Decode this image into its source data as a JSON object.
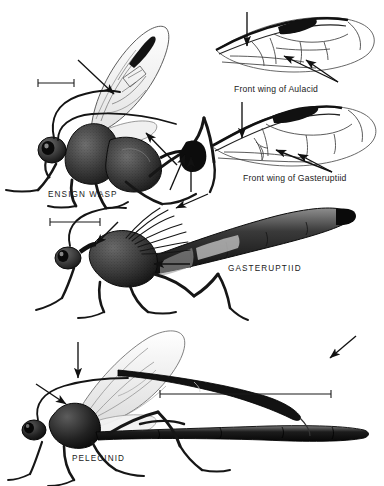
{
  "plate": {
    "title_text_present": false,
    "background_color": "#ffffff",
    "ink_color": "#1a1a1a",
    "medium": "stippled pen-and-ink scientific illustration"
  },
  "figures": [
    {
      "id": "ensign-wasp",
      "label": "ENSIGN WASP",
      "label_pos": {
        "x": 48,
        "y": 196
      },
      "scale_bar": {
        "x1": 38,
        "y1": 83,
        "x2": 74,
        "y2": 83
      },
      "arrows": [
        {
          "name": "arrow-to-forewing-stigma",
          "x1": 78,
          "y1": 60,
          "x2": 112,
          "y2": 92
        },
        {
          "name": "arrow-to-propodeum",
          "x1": 177,
          "y1": 165,
          "x2": 148,
          "y2": 134
        },
        {
          "name": "arrow-to-petiole-upper",
          "x1": 172,
          "y1": 188,
          "x2": 186,
          "y2": 156
        },
        {
          "name": "arrow-to-petiole-lower",
          "x1": 190,
          "y1": 190,
          "x2": 190,
          "y2": 158
        }
      ]
    },
    {
      "id": "gasteruptiid",
      "label": "GASTERUPTIID",
      "label_pos": {
        "x": 228,
        "y": 270
      },
      "scale_bar": {
        "x1": 50,
        "y1": 222,
        "x2": 100,
        "y2": 222
      },
      "arrows": [
        {
          "name": "arrow-to-neck",
          "x1": 115,
          "y1": 228,
          "x2": 98,
          "y2": 246
        },
        {
          "name": "arrow-to-metasoma-attachment",
          "x1": 189,
          "y1": 263,
          "x2": 153,
          "y2": 263
        },
        {
          "name": "arrow-to-abdomen-base",
          "x1": 205,
          "y1": 196,
          "x2": 172,
          "y2": 208
        }
      ]
    },
    {
      "id": "pelecinid",
      "label": "PELECINID",
      "label_pos": {
        "x": 72,
        "y": 460
      },
      "scale_bar": {
        "x1": 160,
        "y1": 394,
        "x2": 331,
        "y2": 394
      },
      "arrows": [
        {
          "name": "arrow-down-to-thorax",
          "x1": 78,
          "y1": 343,
          "x2": 78,
          "y2": 378
        },
        {
          "name": "arrow-to-head",
          "x1": 36,
          "y1": 385,
          "x2": 66,
          "y2": 404
        },
        {
          "name": "arrow-to-detached-antenna",
          "x1": 356,
          "y1": 337,
          "x2": 330,
          "y2": 358
        }
      ]
    }
  ],
  "wing_diagrams": [
    {
      "id": "aulacid-forewing",
      "caption": "Front wing of Aulacid",
      "caption_pos": {
        "x": 234,
        "y": 90
      },
      "arrows": [
        {
          "name": "arrow-down-to-costal-margin",
          "x1": 247,
          "y1": 12,
          "x2": 247,
          "y2": 45
        },
        {
          "name": "arrow-to-cell-1",
          "x1": 336,
          "y1": 80,
          "x2": 283,
          "y2": 58
        },
        {
          "name": "arrow-to-cell-2",
          "x1": 336,
          "y1": 80,
          "x2": 303,
          "y2": 63
        }
      ]
    },
    {
      "id": "gasteruptiid-forewing",
      "caption": "Front wing of Gasteruptiid",
      "caption_pos": {
        "x": 243,
        "y": 179
      },
      "arrows": [
        {
          "name": "arrow-down-to-costal-margin",
          "x1": 242,
          "y1": 105,
          "x2": 242,
          "y2": 137
        },
        {
          "name": "arrow-to-cell-1",
          "x1": 330,
          "y1": 172,
          "x2": 277,
          "y2": 152
        },
        {
          "name": "arrow-to-cell-2",
          "x1": 330,
          "y1": 172,
          "x2": 296,
          "y2": 157
        }
      ]
    }
  ]
}
